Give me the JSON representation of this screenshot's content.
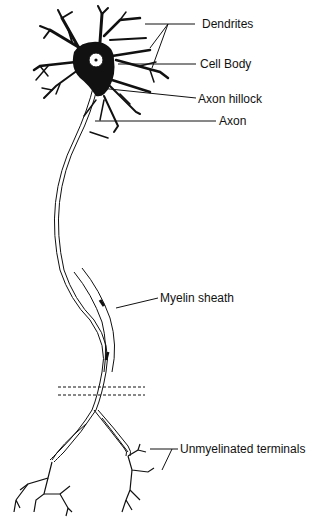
{
  "labels": {
    "dendrites": "Dendrites",
    "cell_body": "Cell Body",
    "axon_hillock": "Axon hillock",
    "axon": "Axon",
    "myelin_sheath": "Myelin sheath",
    "unmyelinated_terminals": "Unmyelinated terminals"
  },
  "colors": {
    "ink": "#111111",
    "background": "#ffffff"
  }
}
